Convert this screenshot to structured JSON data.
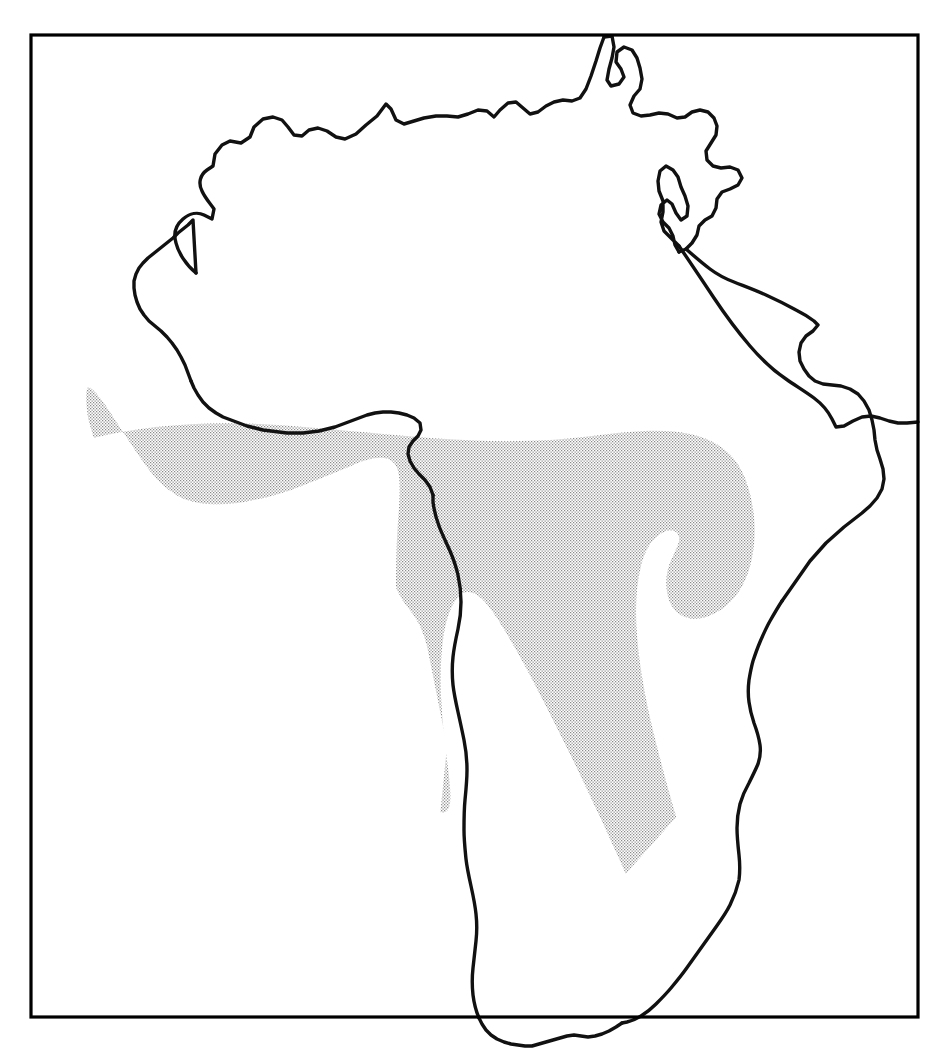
{
  "figure": {
    "domain": "map",
    "kind": "distribution-range-map",
    "region_name": "Africa",
    "caption": "",
    "title": "",
    "background_color": "#ffffff",
    "frame": {
      "name": "map-border-frame",
      "stroke_color": "#000000",
      "stroke_width": 3.2,
      "x": 31,
      "y": 35,
      "width": 887,
      "height": 982
    },
    "coastline": {
      "name": "africa-coastline",
      "stroke_color": "#111111",
      "stroke_width": 3.4,
      "fill": "none",
      "features_visible": [
        "Mediterranean coast",
        "Atlantic coast",
        "Gulf of Guinea",
        "Red Sea",
        "Gulf of Aden",
        "Horn of Africa",
        "Indian Ocean coast",
        "Cape of Good Hope",
        "Sinai Peninsula",
        "Arabian Peninsula (partial)"
      ],
      "madagascar_shown": "no"
    },
    "shaded_range": {
      "name": "stippled-distribution-range",
      "pattern": "fine dot stipple screen",
      "dot_color": "#8a8a8a",
      "dot_pitch_px": 3,
      "tone_percent": 22,
      "covers": "Sub-Saharan tropical Africa",
      "excludes": [
        "Sahara Desert",
        "North Africa",
        "Horn of Africa",
        "Kalahari / Namib southwest",
        "Mediterranean littoral"
      ]
    },
    "legend": {
      "present": "no",
      "items": []
    },
    "labels": {
      "present": "no",
      "items": []
    },
    "scale_bar": {
      "present": "no"
    },
    "north_arrow": {
      "present": "no"
    }
  }
}
